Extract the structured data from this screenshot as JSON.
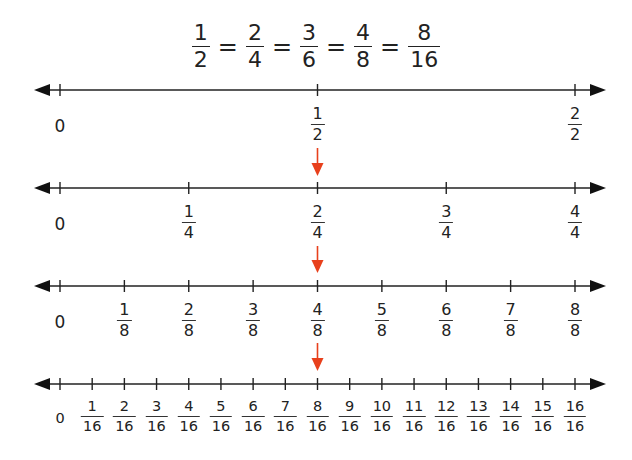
{
  "equation": {
    "terms": [
      {
        "num": "1",
        "den": "2"
      },
      {
        "num": "2",
        "den": "4"
      },
      {
        "num": "3",
        "den": "6"
      },
      {
        "num": "4",
        "den": "8"
      },
      {
        "num": "8",
        "den": "16"
      }
    ],
    "sign": "="
  },
  "colors": {
    "line": "#222222",
    "arrow_red": "#e8401c"
  },
  "number_lines": [
    {
      "denominator": 2,
      "zero_label": "0",
      "ticks": [
        {
          "num": "1",
          "den": "2"
        },
        {
          "num": "2",
          "den": "2"
        }
      ]
    },
    {
      "denominator": 4,
      "zero_label": "0",
      "ticks": [
        {
          "num": "1",
          "den": "4"
        },
        {
          "num": "2",
          "den": "4"
        },
        {
          "num": "3",
          "den": "4"
        },
        {
          "num": "4",
          "den": "4"
        }
      ]
    },
    {
      "denominator": 8,
      "zero_label": "0",
      "ticks": [
        {
          "num": "1",
          "den": "8"
        },
        {
          "num": "2",
          "den": "8"
        },
        {
          "num": "3",
          "den": "8"
        },
        {
          "num": "4",
          "den": "8"
        },
        {
          "num": "5",
          "den": "8"
        },
        {
          "num": "6",
          "den": "8"
        },
        {
          "num": "7",
          "den": "8"
        },
        {
          "num": "8",
          "den": "8"
        }
      ]
    },
    {
      "denominator": 16,
      "zero_label": "0",
      "ticks": [
        {
          "num": "1",
          "den": "16"
        },
        {
          "num": "2",
          "den": "16"
        },
        {
          "num": "3",
          "den": "16"
        },
        {
          "num": "4",
          "den": "16"
        },
        {
          "num": "5",
          "den": "16"
        },
        {
          "num": "6",
          "den": "16"
        },
        {
          "num": "7",
          "den": "16"
        },
        {
          "num": "8",
          "den": "16"
        },
        {
          "num": "9",
          "den": "16"
        },
        {
          "num": "10",
          "den": "16"
        },
        {
          "num": "11",
          "den": "16"
        },
        {
          "num": "12",
          "den": "16"
        },
        {
          "num": "13",
          "den": "16"
        },
        {
          "num": "14",
          "den": "16"
        },
        {
          "num": "15",
          "den": "16"
        },
        {
          "num": "16",
          "den": "16"
        }
      ]
    }
  ],
  "highlight_arrows": {
    "count": 3,
    "position": "1/2"
  }
}
